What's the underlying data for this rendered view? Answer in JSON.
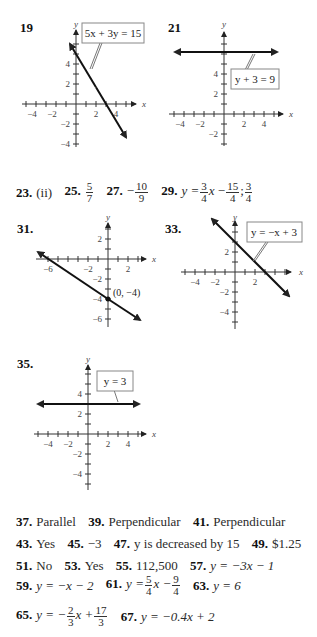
{
  "problems": {
    "p19": {
      "number": "19",
      "equation_label": "5x + 3y = 15"
    },
    "p21": {
      "number": "21",
      "equation_label": "y + 3 = 9"
    },
    "p31": {
      "number": "31.",
      "point_label": "(0, −4)"
    },
    "p33": {
      "number": "33.",
      "equation_label": "y = −x + 3"
    },
    "p35": {
      "number": "35.",
      "equation_label": "y = 3"
    }
  },
  "axis_labels": {
    "x": "x",
    "y": "y"
  },
  "tick_labels": {
    "neg6": "−6",
    "neg4": "−4",
    "neg2": "−2",
    "pos2": "2",
    "pos4": "4"
  },
  "row_23_29": {
    "a23": {
      "num": "23.",
      "text": "(ii)"
    },
    "a25": {
      "num": "25.",
      "frac_top": "5",
      "frac_bottom": "7"
    },
    "a27": {
      "num": "27.",
      "sign": "−",
      "frac_top": "10",
      "frac_bottom": "9"
    },
    "a29": {
      "num": "29.",
      "lhs": "y =",
      "f1_top": "3",
      "f1_bottom": "4",
      "x": "x",
      "op": "−",
      "f2_top": "15",
      "f2_bottom": "4",
      "sep": ";",
      "f3_top": "3",
      "f3_bottom": "4"
    }
  },
  "answers": {
    "a37": {
      "num": "37.",
      "text": "Parallel"
    },
    "a39": {
      "num": "39.",
      "text": "Perpendicular"
    },
    "a41": {
      "num": "41.",
      "text": "Perpendicular"
    },
    "a43": {
      "num": "43.",
      "text": "Yes"
    },
    "a45": {
      "num": "45.",
      "text": "−3"
    },
    "a47": {
      "num": "47.",
      "text": "y is decreased by 15"
    },
    "a49": {
      "num": "49.",
      "text": "$1.25"
    },
    "a51": {
      "num": "51.",
      "text": "No"
    },
    "a53": {
      "num": "53.",
      "text": "Yes"
    },
    "a55": {
      "num": "55.",
      "text": "112,500"
    },
    "a57": {
      "num": "57.",
      "text": "y = −3x − 1"
    },
    "a59": {
      "num": "59.",
      "text": "y = −x − 2"
    },
    "a61": {
      "num": "61.",
      "lhs": "y =",
      "f1_top": "5",
      "f1_bottom": "4",
      "mid": "x −",
      "f2_top": "9",
      "f2_bottom": "4"
    },
    "a63": {
      "num": "63.",
      "text": "y = 6"
    },
    "a65": {
      "num": "65.",
      "lhs": "y = −",
      "f1_top": "2",
      "f1_bottom": "3",
      "mid": "x +",
      "f2_top": "17",
      "f2_bottom": "3"
    },
    "a67": {
      "num": "67.",
      "text": "y = −0.4x + 2"
    }
  }
}
